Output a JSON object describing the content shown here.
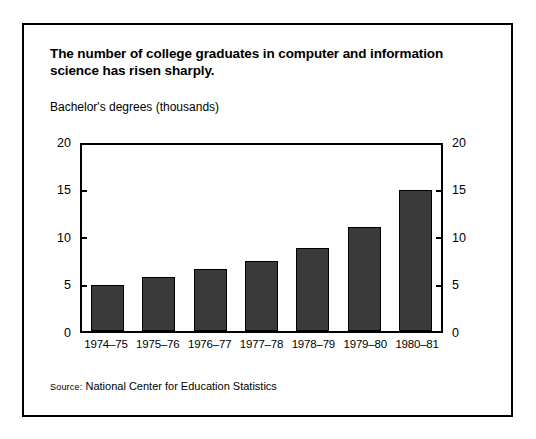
{
  "chart_data": {
    "type": "bar",
    "title": "The number of college graduates in computer and information science has risen sharply.",
    "title_lines": [
      "The number of college graduates in computer and information",
      "science has risen sharply."
    ],
    "subtitle": "Bachelor's degrees (thousands)",
    "xlabel": "",
    "ylabel": "Bachelor's degrees (thousands)",
    "categories": [
      "1974–75",
      "1975–76",
      "1976–77",
      "1977–78",
      "1978–79",
      "1979–80",
      "1980–81"
    ],
    "values": [
      5.0,
      5.8,
      6.7,
      7.5,
      8.9,
      11.2,
      15.2
    ],
    "ylim": [
      0,
      20
    ],
    "yticks": [
      0,
      5,
      10,
      15,
      20
    ],
    "ytick_labels": [
      "0",
      "5",
      "10",
      "15",
      "20"
    ],
    "grid": false,
    "legend": null,
    "legend_position": "none",
    "right_axis": true,
    "right_ytick_labels": [
      "0",
      "5",
      "10",
      "15",
      "20"
    ],
    "bar_color": "#3a3a3a",
    "bar_edge_color": "#000000",
    "background_color": "#ffffff"
  },
  "source": {
    "label": "Source:",
    "text": "National Center for Education Statistics"
  }
}
